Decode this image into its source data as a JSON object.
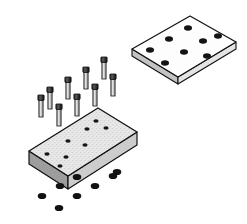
{
  "document": {
    "type": "technical-illustration",
    "style": "exploded-isometric-assembly",
    "width": 247,
    "height": 224,
    "background_color": "#ffffff",
    "line_color": "#1a1a1a",
    "title": "Exploded view of two bolted plates with screws and nuts"
  },
  "palette": {
    "outline": "#111111",
    "paper_white": "#ffffff",
    "plate_top_face_light": "#f2f2f2",
    "plate_top_face_stipple": "#d2d2d2",
    "plate_side_front": "#c9c9c9",
    "plate_side_left": "#9a9a9a",
    "thin_plate_edge": "#dddddd",
    "thin_plate_edge_dark": "#b4b4b4",
    "hole_fill": "#161616",
    "screw_head": "#2a2a2a",
    "screw_shaft": "#e2e2e2",
    "screw_shaft_shadow": "#8d8d8d",
    "nut_fill": "#131313"
  },
  "parts": [
    {
      "id": "upper-plate",
      "name": "Upper Mounting Plate",
      "description": "Thin flat rectangular plate shown in isometric projection at the upper right, drawn in outline with a white top face and a shallow visible thickness along the near edges.",
      "hole_count": 8,
      "hole_rows": 2,
      "hole_columns": 4,
      "thickness": "thin",
      "surface_shading": "none",
      "position": "upper-right"
    },
    {
      "id": "fasteners",
      "name": "Socket Head Cap Screws",
      "description": "Eight identical cap screws floating in the middle of the drawing between the two plates, each with a dark cylindrical head and a lighter shaded shank.",
      "count": 8,
      "rows": 2,
      "per_row": 4,
      "position": "center"
    },
    {
      "id": "lower-plate",
      "name": "Lower Base Plate",
      "description": "Thicker rectangular plate shown in isometric projection at the lower left, with a light stippled grey top face and two visible darker side faces indicating material thickness.",
      "hole_count": 8,
      "hole_rows": 2,
      "hole_columns": 4,
      "thickness": "thick",
      "surface_shading": "stipple-grey",
      "position": "lower-left"
    },
    {
      "id": "nuts",
      "name": "Hex Nuts",
      "description": "Ten small solid black circular nuts scattered below the lower base plate, representing the fasteners that thread onto the screws from underneath.",
      "count": 10,
      "position": "below-lower-plate"
    }
  ],
  "geometry": {
    "upper_plate": {
      "corners_top": [
        [
          132,
          49
        ],
        [
          190,
          16
        ],
        [
          236,
          42
        ],
        [
          178,
          77
        ]
      ],
      "thickness_offset": 7,
      "holes": [
        [
          150,
          49
        ],
        [
          168,
          39
        ],
        [
          186,
          29
        ],
        [
          204,
          19
        ],
        [
          163,
          63
        ],
        [
          181,
          53
        ],
        [
          199,
          43
        ],
        [
          217,
          33
        ]
      ],
      "hole_rx": 4.0,
      "hole_ry": 2.6
    },
    "lower_plate": {
      "corners_top": [
        [
          29,
          151
        ],
        [
          98,
          108
        ],
        [
          137,
          132
        ],
        [
          68,
          176
        ]
      ],
      "thickness_offset": 13,
      "holes": [
        [
          44,
          154
        ],
        [
          63,
          142
        ],
        [
          82,
          130
        ],
        [
          101,
          118
        ],
        [
          60,
          165
        ],
        [
          79,
          153
        ],
        [
          98,
          141
        ],
        [
          117,
          129
        ]
      ],
      "hole_rx": 3.4,
      "hole_ry": 2.2
    },
    "screws": [
      [
        43,
        96
      ],
      [
        60,
        86
      ],
      [
        78,
        76
      ],
      [
        96,
        66
      ],
      [
        30,
        103
      ],
      [
        48,
        93
      ],
      [
        66,
        83
      ],
      [
        84,
        73
      ]
    ],
    "screw_head_w": 6,
    "screw_head_h": 5,
    "screw_shaft_w": 4,
    "screw_shaft_h": 17,
    "nuts": [
      [
        60,
        186
      ],
      [
        76,
        177
      ],
      [
        97,
        165
      ],
      [
        114,
        156
      ],
      [
        42,
        197
      ],
      [
        60,
        207
      ],
      [
        78,
        191
      ],
      [
        95,
        180
      ],
      [
        112,
        170
      ],
      [
        43,
        186
      ]
    ],
    "nut_rx": 4.2,
    "nut_ry": 3.0
  }
}
